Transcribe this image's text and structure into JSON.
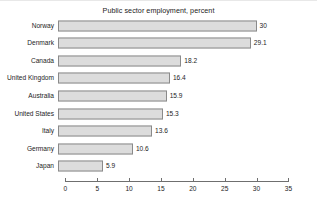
{
  "chart_data": {
    "type": "bar",
    "orientation": "horizontal",
    "title": "Public sector employment, percent",
    "xlabel": "",
    "ylabel": "",
    "xlim": [
      0,
      35
    ],
    "xticks": [
      0,
      5,
      10,
      15,
      20,
      25,
      30,
      35
    ],
    "grid": false,
    "legend": null,
    "bar_fill_color": "#dcdcdc",
    "bar_edge_color": "#8a8a8a",
    "axis_color": "#6f6f6f",
    "categories": [
      "Norway",
      "Denmark",
      "Canada",
      "United Kingdom",
      "Australia",
      "United States",
      "Italy",
      "Germany",
      "Japan"
    ],
    "values": [
      30,
      29.1,
      18.2,
      16.4,
      15.9,
      15.3,
      13.6,
      10.6,
      5.9
    ],
    "value_labels": [
      "30",
      "29.1",
      "18.2",
      "16.4",
      "15.9",
      "15.3",
      "13.6",
      "10.6",
      "5.9"
    ],
    "tick_labels": [
      "0",
      "5",
      "10",
      "15",
      "20",
      "25",
      "30",
      "35"
    ]
  }
}
